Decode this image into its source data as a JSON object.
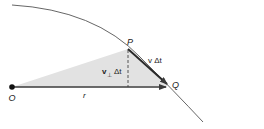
{
  "diagram": {
    "labels": {
      "origin": "O",
      "point_p": "P",
      "point_q": "Q",
      "radius": "r",
      "velocity_displacement": "v Δt",
      "perp_v": "v",
      "perp_sub": "⊥",
      "perp_dt": "Δt"
    },
    "colors": {
      "curve": "#555555",
      "shading": "#e2e2e2",
      "vector": "#3a3a3a",
      "dashed": "#444444",
      "text": "#222222"
    },
    "elements": [
      "trajectory curve",
      "shaded triangle OPQ",
      "radius vector r from O to Q",
      "displacement vector v Δt from P to Q",
      "dashed perpendicular v⊥ Δt from P to r"
    ]
  }
}
